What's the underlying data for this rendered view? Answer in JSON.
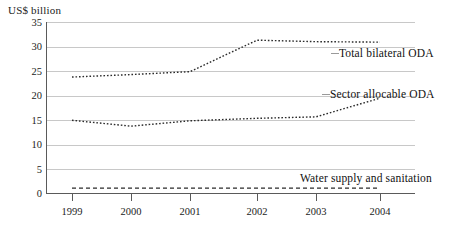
{
  "chart_data": {
    "type": "line",
    "title": "",
    "subtitle": "",
    "xlabel": "",
    "ylabel": "US$ billion",
    "ylim": [
      0,
      35
    ],
    "yticks": [
      0,
      5,
      10,
      15,
      20,
      25,
      30,
      35
    ],
    "ytick_labels": [
      "0",
      "5",
      "10",
      "15",
      "20",
      "25",
      "30",
      "35"
    ],
    "categories": [
      "1999",
      "2000",
      "2001",
      "2002",
      "2003",
      "2004"
    ],
    "x": [
      1999,
      2000,
      2001,
      2002,
      2003,
      2004
    ],
    "grid": true,
    "legend_position": "inline-annotation",
    "series": [
      {
        "name": "Total bilateral ODA",
        "values": [
          23.8,
          24.3,
          24.9,
          31.3,
          31.0,
          30.9
        ],
        "style": "dotted"
      },
      {
        "name": "Sector allocable ODA",
        "values": [
          15.0,
          13.8,
          14.9,
          15.4,
          15.7,
          19.5
        ],
        "style": "dotted"
      },
      {
        "name": "Water supply and sanitation",
        "values": [
          1.2,
          1.2,
          1.2,
          1.2,
          1.2,
          1.2
        ],
        "style": "dashed"
      }
    ],
    "annotations": [
      {
        "text": "Total bilateral ODA",
        "series": "Total bilateral ODA"
      },
      {
        "text": "Sector allocable ODA",
        "series": "Sector allocable ODA"
      },
      {
        "text": "Water supply and sanitation",
        "series": "Water supply and sanitation"
      }
    ],
    "colors": {
      "line": "#2b2b2b",
      "grid": "#c8c8c8",
      "axis": "#5a5a5a",
      "text": "#1b1b1b",
      "background": "#ffffff"
    }
  }
}
